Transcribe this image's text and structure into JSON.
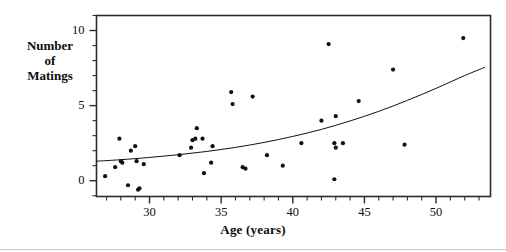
{
  "chart_data": {
    "type": "scatter",
    "title": "",
    "xlabel": "Age (years)",
    "ylabel": "Number of Matings",
    "ylabel_lines": [
      "Number",
      "of",
      "Matings"
    ],
    "xlim": [
      26.3,
      53.8
    ],
    "ylim": [
      -1.05,
      11.0
    ],
    "xticks": [
      30,
      35,
      40,
      45,
      50
    ],
    "xtick_labels": [
      "30",
      "35",
      "40",
      "45",
      "50"
    ],
    "xtick_minor_step": 1,
    "yticks": [
      0,
      5,
      10
    ],
    "ytick_labels": [
      "0",
      "5",
      "10"
    ],
    "ytick_minor_step": 1,
    "grid": false,
    "legend": "none",
    "frame": "box",
    "marker": "filled-circle",
    "marker_color": "#111111",
    "marker_size_px": 4.0,
    "line_color": "#111111",
    "line_width_px": 1.0,
    "points": [
      {
        "x": 26.9,
        "y": 0.3
      },
      {
        "x": 27.6,
        "y": 0.9
      },
      {
        "x": 27.9,
        "y": 2.8
      },
      {
        "x": 28.0,
        "y": 1.3
      },
      {
        "x": 28.1,
        "y": 1.2
      },
      {
        "x": 28.5,
        "y": -0.3
      },
      {
        "x": 28.7,
        "y": 2.0
      },
      {
        "x": 29.0,
        "y": 2.3
      },
      {
        "x": 29.1,
        "y": 1.3
      },
      {
        "x": 29.2,
        "y": -0.6
      },
      {
        "x": 29.3,
        "y": -0.5
      },
      {
        "x": 29.6,
        "y": 1.1
      },
      {
        "x": 32.1,
        "y": 1.7
      },
      {
        "x": 32.9,
        "y": 2.2
      },
      {
        "x": 33.0,
        "y": 2.7
      },
      {
        "x": 33.2,
        "y": 2.8
      },
      {
        "x": 33.3,
        "y": 3.5
      },
      {
        "x": 33.7,
        "y": 2.8
      },
      {
        "x": 33.8,
        "y": 0.5
      },
      {
        "x": 34.3,
        "y": 1.2
      },
      {
        "x": 34.4,
        "y": 2.3
      },
      {
        "x": 35.7,
        "y": 5.9
      },
      {
        "x": 35.8,
        "y": 5.1
      },
      {
        "x": 36.5,
        "y": 0.9
      },
      {
        "x": 36.7,
        "y": 0.8
      },
      {
        "x": 37.2,
        "y": 5.6
      },
      {
        "x": 38.2,
        "y": 1.7
      },
      {
        "x": 39.3,
        "y": 1.0
      },
      {
        "x": 40.6,
        "y": 2.5
      },
      {
        "x": 42.0,
        "y": 4.0
      },
      {
        "x": 42.5,
        "y": 9.1
      },
      {
        "x": 42.9,
        "y": 2.5
      },
      {
        "x": 42.9,
        "y": 0.1
      },
      {
        "x": 43.0,
        "y": 4.3
      },
      {
        "x": 43.0,
        "y": 2.2
      },
      {
        "x": 43.5,
        "y": 2.5
      },
      {
        "x": 44.6,
        "y": 5.3
      },
      {
        "x": 47.0,
        "y": 7.4
      },
      {
        "x": 47.8,
        "y": 2.4
      },
      {
        "x": 51.9,
        "y": 9.5
      }
    ],
    "fit_curve": {
      "description": "exponential/Poisson regression fit",
      "x": [
        26.3,
        28.0,
        30.0,
        32.0,
        34.0,
        36.0,
        38.0,
        40.0,
        42.0,
        44.0,
        46.0,
        48.0,
        50.0,
        52.0,
        53.4
      ],
      "y": [
        1.3,
        1.4,
        1.55,
        1.73,
        1.95,
        2.22,
        2.55,
        2.95,
        3.42,
        3.98,
        4.62,
        5.35,
        6.15,
        7.0,
        7.55
      ]
    }
  }
}
